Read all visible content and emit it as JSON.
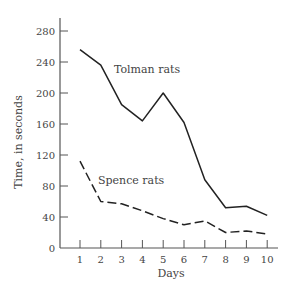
{
  "chart_data": {
    "type": "line",
    "title": "",
    "xlabel": "Days",
    "ylabel": "Time, in seconds",
    "x": [
      1,
      2,
      3,
      4,
      5,
      6,
      7,
      8,
      9,
      10
    ],
    "x_ticks": [
      "1",
      "2",
      "3",
      "4",
      "5",
      "6",
      "7",
      "8",
      "9",
      "10"
    ],
    "y_ticks": [
      "0",
      "40",
      "80",
      "120",
      "160",
      "200",
      "240",
      "280"
    ],
    "ylim": [
      0,
      280
    ],
    "grid": false,
    "legend": "inline labels",
    "series": [
      {
        "name": "Tolman rats",
        "style": "solid",
        "values": [
          256,
          236,
          185,
          164,
          200,
          162,
          88,
          52,
          54,
          42
        ]
      },
      {
        "name": "Spence rats",
        "style": "dashed",
        "values": [
          112,
          60,
          57,
          48,
          38,
          30,
          35,
          20,
          22,
          18
        ]
      }
    ],
    "annotations": [
      {
        "text": "Tolman rats",
        "near": "day 2-4, ~235"
      },
      {
        "text": "Spence rats",
        "near": "day 2-4, ~90"
      }
    ]
  }
}
